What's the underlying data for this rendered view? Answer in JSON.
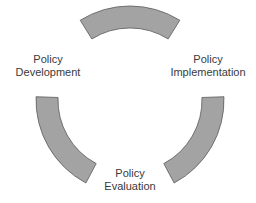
{
  "diagram": {
    "type": "cycle",
    "stages": [
      {
        "id": "development",
        "line1": "Policy",
        "line2": "Development"
      },
      {
        "id": "implementation",
        "line1": "Policy",
        "line2": "Implementation"
      },
      {
        "id": "evaluation",
        "line1": "Policy",
        "line2": "Evaluation"
      }
    ],
    "arc_fill": "#a3a3a3",
    "arc_stroke": "#5a5a5a",
    "text_color": "#3a3a3a"
  }
}
